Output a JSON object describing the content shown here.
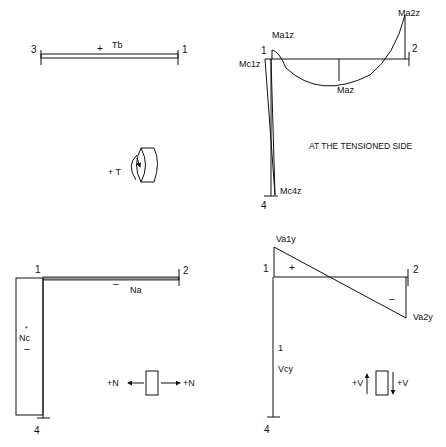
{
  "torsion_panel": {
    "node_left": "3",
    "node_right": "1",
    "sign": "+",
    "label": "Tb",
    "convention_label": "+ T"
  },
  "moment_panel": {
    "node_top_left": "1",
    "node_right": "2",
    "node_bottom": "4",
    "labels": {
      "ma1z": "Ma1z",
      "ma2z": "Ma2z",
      "maz": "Maz",
      "mc1z": "Mc1z",
      "mc4z": "Mc4z"
    },
    "note": "AT THE TENSIONED SIDE"
  },
  "axial_panel": {
    "node_top_left": "1",
    "node_right": "2",
    "node_bottom": "4",
    "beam_sign": "–",
    "beam_label": "Na",
    "column_label": "Nc",
    "column_sign": "–",
    "convention_left": "+N",
    "convention_right": "+N"
  },
  "shear_panel": {
    "node_top_left": "1",
    "node_right": "2",
    "node_bottom": "4",
    "positive_sign": "+",
    "negative_sign": "–",
    "labels": {
      "va1y": "Va1y",
      "va2y": "Va2y",
      "vcy": "Vcy",
      "vcy_tick": "1"
    },
    "convention_left": "+V",
    "convention_right": "+V"
  }
}
